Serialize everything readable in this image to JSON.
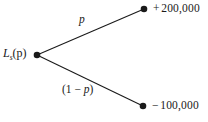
{
  "diagram": {
    "type": "decision-tree",
    "background_color": "#ffffff",
    "stroke_color": "#1a1a1a",
    "text_color": "#1a1a1a",
    "root": {
      "label_base": "L",
      "label_subscript": "s",
      "label_argument": "(p)",
      "node_x": 37,
      "node_y": 55
    },
    "branches": [
      {
        "name": "upper-branch",
        "probability_label": "p",
        "outcome_sign": "+",
        "outcome_value": "200,000",
        "node_x": 144,
        "node_y": 9
      },
      {
        "name": "lower-branch",
        "probability_label_prefix": "(1 ",
        "probability_label_operator": "−",
        "probability_label_variable": " p",
        "probability_label_suffix": ")",
        "outcome_sign": "−",
        "outcome_value": "100,000",
        "node_x": 143,
        "node_y": 106
      }
    ]
  }
}
